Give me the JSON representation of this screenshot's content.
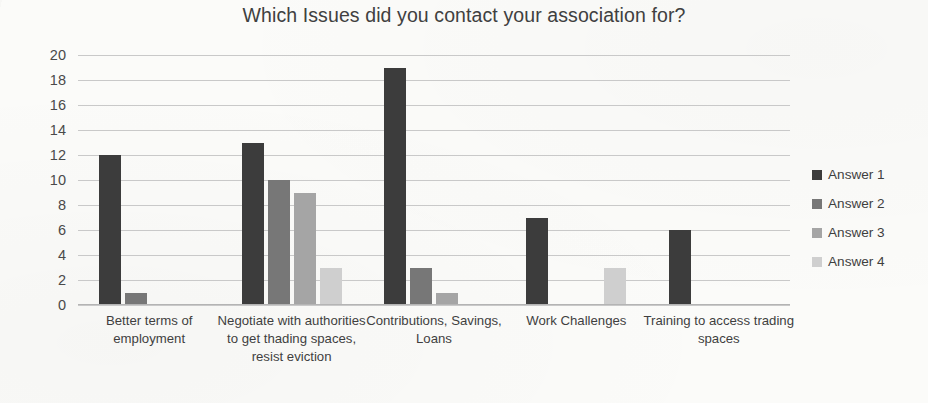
{
  "chart_data": {
    "type": "bar",
    "title": "Which Issues did you contact your association for?",
    "xlabel": "",
    "ylabel": "",
    "ylim": [
      0,
      20
    ],
    "ytick_step": 2,
    "yticks": [
      "20",
      "18",
      "16",
      "14",
      "12",
      "10",
      "8",
      "6",
      "4",
      "2",
      "0"
    ],
    "grid": "horizontal",
    "legend_position": "right",
    "categories": [
      "Better terms of employment",
      "Negotiate with authorities to get thading spaces, resist eviction",
      "Contributions, Savings, Loans",
      "Work Challenges",
      "Training to access trading spaces"
    ],
    "series": [
      {
        "name": "Answer 1",
        "color": "#3c3c3c",
        "values": [
          12,
          13,
          19,
          7,
          6
        ]
      },
      {
        "name": "Answer 2",
        "color": "#777777",
        "values": [
          1,
          10,
          3,
          0,
          0
        ]
      },
      {
        "name": "Answer 3",
        "color": "#a5a5a5",
        "values": [
          0,
          9,
          1,
          0,
          0
        ]
      },
      {
        "name": "Answer 4",
        "color": "#cfcfcf",
        "values": [
          0,
          3,
          0,
          3,
          0
        ]
      }
    ]
  },
  "legend": {
    "items": [
      {
        "label": "Answer 1",
        "color": "#3c3c3c"
      },
      {
        "label": "Answer 2",
        "color": "#777777"
      },
      {
        "label": "Answer 3",
        "color": "#a5a5a5"
      },
      {
        "label": "Answer 4",
        "color": "#cfcfcf"
      }
    ]
  }
}
